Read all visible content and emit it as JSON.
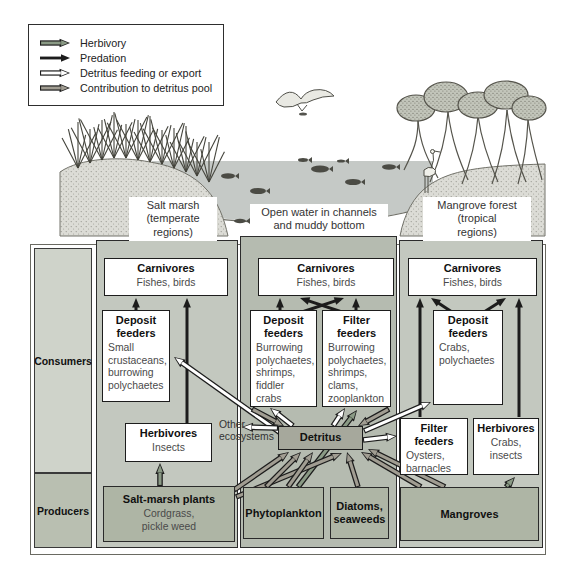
{
  "legend": {
    "items": [
      {
        "type": "herbivory",
        "label": "Herbivory"
      },
      {
        "type": "predation",
        "label": "Predation"
      },
      {
        "type": "detritus",
        "label": "Detritus feeding or export"
      },
      {
        "type": "contribution",
        "label": "Contribution to detritus pool"
      }
    ]
  },
  "colors": {
    "herbivory": "#8a9a85",
    "predation": "#1c1c1c",
    "detritus": "#ffffff",
    "contribution": "#a19d92",
    "outline": "#1c1c1c"
  },
  "habitats": {
    "salt_marsh": "Salt marsh\n(temperate\nregions)",
    "open_water": "Open water in channels\nand muddy bottom",
    "mangrove": "Mangrove forest\n(tropical\nregions)"
  },
  "sidebar": {
    "consumers": "Consumers",
    "producers": "Producers"
  },
  "boxes": {
    "carnivores_left": {
      "title": "Carnivores",
      "items": "Fishes, birds"
    },
    "deposit_left": {
      "title": "Deposit\nfeeders",
      "items": "Small\ncrustaceans,\nburrowing\npolychaetes"
    },
    "herbivores_left": {
      "title": "Herbivores",
      "items": "Insects"
    },
    "salt_marsh_plants": {
      "title": "Salt-marsh plants",
      "items": "Cordgrass,\npickle weed"
    },
    "carnivores_mid": {
      "title": "Carnivores",
      "items": "Fishes, birds"
    },
    "deposit_mid": {
      "title": "Deposit\nfeeders",
      "items": "Burrowing\npolychaetes,\nshrimps,\nfiddler\ncrabs"
    },
    "filter_mid": {
      "title": "Filter\nfeeders",
      "items": "Burrowing\npolychaetes,\nshrimps,\nclams,\nzooplankton"
    },
    "detritus": {
      "title": "Detritus",
      "items": ""
    },
    "phytoplankton": {
      "title": "Phytoplankton",
      "items": ""
    },
    "diatoms": {
      "title": "Diatoms,\nseaweeds",
      "items": ""
    },
    "carnivores_right": {
      "title": "Carnivores",
      "items": "Fishes, birds"
    },
    "deposit_right": {
      "title": "Deposit\nfeeders",
      "items": "Crabs,\npolychaetes"
    },
    "filter_right": {
      "title": "Filter\nfeeders",
      "items": "Oysters,\nbarnacles"
    },
    "herbivores_right": {
      "title": "Herbivores",
      "items": "Crabs,\ninsects"
    },
    "mangroves": {
      "title": "Mangroves",
      "items": ""
    }
  },
  "other_ecosystems": "Other\necosystems",
  "arrows": [
    {
      "t": "predation",
      "from": "deposit_left",
      "to": "carnivores_left",
      "x1": 136,
      "y1": 312,
      "x2": 136,
      "y2": 298
    },
    {
      "t": "predation",
      "from": "herbivores_left",
      "to": "carnivores_left",
      "x1": 187,
      "y1": 424,
      "x2": 187,
      "y2": 298
    },
    {
      "t": "predation",
      "from": "deposit_mid",
      "to": "carnivores_mid",
      "x1": 280,
      "y1": 312,
      "x2": 280,
      "y2": 298
    },
    {
      "t": "predation",
      "from": "deposit_mid",
      "to": "carnivores_mid",
      "x1": 302,
      "y1": 312,
      "x2": 344,
      "y2": 298
    },
    {
      "t": "predation",
      "from": "filter_mid",
      "to": "carnivores_mid",
      "x1": 342,
      "y1": 312,
      "x2": 300,
      "y2": 298
    },
    {
      "t": "predation",
      "from": "filter_mid",
      "to": "carnivores_mid",
      "x1": 356,
      "y1": 312,
      "x2": 356,
      "y2": 298
    },
    {
      "t": "predation",
      "from": "filter_right",
      "to": "carnivores_right",
      "x1": 420,
      "y1": 417,
      "x2": 420,
      "y2": 298
    },
    {
      "t": "predation",
      "from": "herbivores_right",
      "to": "carnivores_right",
      "x1": 519,
      "y1": 417,
      "x2": 519,
      "y2": 298
    },
    {
      "t": "predation",
      "from": "deposit_right",
      "to": "carnivores_right",
      "x1": 452,
      "y1": 312,
      "x2": 431,
      "y2": 298
    },
    {
      "t": "predation",
      "from": "deposit_right",
      "to": "carnivores_right",
      "x1": 484,
      "y1": 312,
      "x2": 506,
      "y2": 298
    },
    {
      "t": "herbivory",
      "from": "salt_marsh_plants",
      "to": "herbivores_left",
      "x1": 160,
      "y1": 486,
      "x2": 160,
      "y2": 463
    },
    {
      "t": "herbivory",
      "from": "phytoplankton",
      "to": "filter_mid",
      "x1": 298,
      "y1": 487,
      "x2": 357,
      "y2": 410
    },
    {
      "t": "herbivory",
      "from": "mangroves",
      "to": "herbivores_right",
      "x1": 506,
      "y1": 487,
      "x2": 515,
      "y2": 477
    },
    {
      "t": "detritus",
      "from": "detritus",
      "to": "deposit_left",
      "x1": 282,
      "y1": 434,
      "x2": 174,
      "y2": 357
    },
    {
      "t": "detritus",
      "from": "detritus",
      "to": "other_ecosystems",
      "x1": 278,
      "y1": 428,
      "x2": 242,
      "y2": 427
    },
    {
      "t": "detritus",
      "from": "detritus",
      "to": "deposit_mid",
      "x1": 293,
      "y1": 426,
      "x2": 270,
      "y2": 408
    },
    {
      "t": "detritus",
      "from": "detritus",
      "to": "filter_mid",
      "x1": 333,
      "y1": 426,
      "x2": 345,
      "y2": 408
    },
    {
      "t": "detritus",
      "from": "detritus",
      "to": "deposit_right",
      "x1": 364,
      "y1": 431,
      "x2": 431,
      "y2": 402
    },
    {
      "t": "detritus",
      "from": "detritus",
      "to": "filter_right",
      "x1": 363,
      "y1": 440,
      "x2": 397,
      "y2": 436
    },
    {
      "t": "contribution",
      "from": "salt_marsh_plants",
      "to": "detritus",
      "x1": 234,
      "y1": 490,
      "x2": 289,
      "y2": 452
    },
    {
      "t": "contribution",
      "from": "salt_marsh_plants",
      "to": "detritus",
      "x1": 236,
      "y1": 497,
      "x2": 342,
      "y2": 453
    },
    {
      "t": "contribution",
      "from": "phytoplankton",
      "to": "detritus",
      "x1": 266,
      "y1": 487,
      "x2": 301,
      "y2": 452
    },
    {
      "t": "contribution",
      "from": "phytoplankton",
      "to": "detritus",
      "x1": 288,
      "y1": 487,
      "x2": 313,
      "y2": 452
    },
    {
      "t": "contribution",
      "from": "diatoms",
      "to": "detritus",
      "x1": 358,
      "y1": 487,
      "x2": 347,
      "y2": 452
    },
    {
      "t": "contribution",
      "from": "mangroves",
      "to": "detritus",
      "x1": 421,
      "y1": 487,
      "x2": 361,
      "y2": 452
    },
    {
      "t": "contribution",
      "from": "mangroves",
      "to": "detritus",
      "x1": 445,
      "y1": 487,
      "x2": 368,
      "y2": 449
    },
    {
      "t": "contribution",
      "from": "deposit_mid",
      "to": "detritus",
      "x1": 252,
      "y1": 409,
      "x2": 284,
      "y2": 426
    },
    {
      "t": "contribution",
      "from": "filter_mid",
      "to": "detritus",
      "x1": 389,
      "y1": 409,
      "x2": 358,
      "y2": 426
    }
  ]
}
